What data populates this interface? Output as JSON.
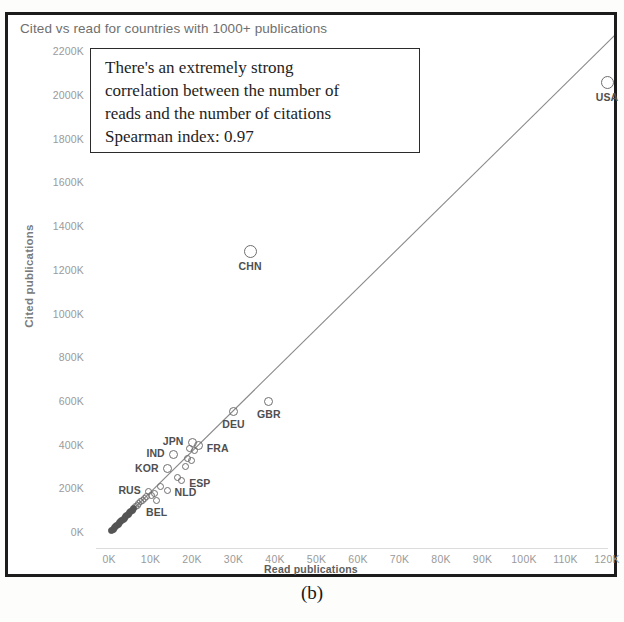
{
  "figure": {
    "caption": "(b)",
    "chart_title": "Cited vs read for countries with 1000+ publications"
  },
  "annotation": {
    "line1": "There's an extremely strong",
    "line2": "correlation between the number of",
    "line3": "reads and the number of citations",
    "line4": "Spearman index: 0.97"
  },
  "chart_data": {
    "type": "scatter",
    "title": "Cited vs read for countries with 1000+ publications",
    "xlabel": "Read publications",
    "ylabel": "Cited publications",
    "xlim": [
      0,
      125000
    ],
    "ylim": [
      0,
      2300000
    ],
    "grid": false,
    "legend": null,
    "spearman_index": 0.97,
    "trendline": {
      "type": "linear",
      "x0": 0,
      "y0": 0,
      "x1": 122000,
      "y1": 2280000
    },
    "xticks": [
      "0K",
      "10K",
      "20K",
      "30K",
      "40K",
      "50K",
      "60K",
      "70K",
      "80K",
      "90K",
      "100K",
      "110K",
      "120K"
    ],
    "xtick_values": [
      0,
      10000,
      20000,
      30000,
      40000,
      50000,
      60000,
      70000,
      80000,
      90000,
      100000,
      110000,
      120000
    ],
    "yticks": [
      "0K",
      "200K",
      "400K",
      "600K",
      "800K",
      "1000K",
      "1200K",
      "1400K",
      "1600K",
      "1800K",
      "2000K",
      "2200K"
    ],
    "ytick_values": [
      0,
      200000,
      400000,
      600000,
      800000,
      1000000,
      1200000,
      1400000,
      1600000,
      1800000,
      2000000,
      2200000
    ],
    "points": [
      {
        "label": "USA",
        "x": 120000,
        "y": 2060000,
        "label_pos": "below",
        "size": "large"
      },
      {
        "label": "CHN",
        "x": 34000,
        "y": 1290000,
        "label_pos": "below",
        "size": "large"
      },
      {
        "label": "GBR",
        "x": 38500,
        "y": 600000,
        "label_pos": "below",
        "size": "medium"
      },
      {
        "label": "DEU",
        "x": 30000,
        "y": 555000,
        "label_pos": "below",
        "size": "medium"
      },
      {
        "label": "FRA",
        "x": 21500,
        "y": 400000,
        "label_pos": "right",
        "size": "medium"
      },
      {
        "label": "JPN",
        "x": 20000,
        "y": 415000,
        "label_pos": "left",
        "size": "medium"
      },
      {
        "label": "IND",
        "x": 15500,
        "y": 360000,
        "label_pos": "left",
        "size": "medium"
      },
      {
        "label": "KOR",
        "x": 14000,
        "y": 295000,
        "label_pos": "left",
        "size": "medium"
      },
      {
        "label": "ESP",
        "x": 17500,
        "y": 240000,
        "label_pos": "right",
        "size": "small"
      },
      {
        "label": "NLD",
        "x": 14000,
        "y": 195000,
        "label_pos": "right",
        "size": "small"
      },
      {
        "label": "RUS",
        "x": 9500,
        "y": 190000,
        "label_pos": "left",
        "size": "small"
      },
      {
        "label": "BEL",
        "x": 11500,
        "y": 150000,
        "label_pos": "below",
        "size": "small"
      }
    ],
    "unlabeled_points": [
      {
        "x": 19500,
        "y": 385000
      },
      {
        "x": 20500,
        "y": 378000
      },
      {
        "x": 19000,
        "y": 340000
      },
      {
        "x": 19800,
        "y": 330000
      },
      {
        "x": 18500,
        "y": 305000
      },
      {
        "x": 16500,
        "y": 255000
      },
      {
        "x": 12500,
        "y": 215000
      },
      {
        "x": 11000,
        "y": 180000
      },
      {
        "x": 10200,
        "y": 172000
      },
      {
        "x": 9000,
        "y": 165000
      },
      {
        "x": 8500,
        "y": 160000
      },
      {
        "x": 8000,
        "y": 150000
      },
      {
        "x": 7600,
        "y": 143000
      },
      {
        "x": 7200,
        "y": 135000
      },
      {
        "x": 6800,
        "y": 128000
      },
      {
        "x": 6400,
        "y": 120000
      },
      {
        "x": 6000,
        "y": 112000
      },
      {
        "x": 5600,
        "y": 105000
      },
      {
        "x": 5200,
        "y": 98000
      },
      {
        "x": 4900,
        "y": 92000
      },
      {
        "x": 4600,
        "y": 86000
      },
      {
        "x": 4300,
        "y": 80000
      },
      {
        "x": 4000,
        "y": 74000
      },
      {
        "x": 3700,
        "y": 68000
      },
      {
        "x": 3400,
        "y": 62000
      },
      {
        "x": 3100,
        "y": 57000
      },
      {
        "x": 2800,
        "y": 52000
      },
      {
        "x": 2500,
        "y": 46000
      },
      {
        "x": 2200,
        "y": 41000
      },
      {
        "x": 1900,
        "y": 35000
      },
      {
        "x": 1600,
        "y": 29000
      },
      {
        "x": 1300,
        "y": 23000
      },
      {
        "x": 1000,
        "y": 18000
      },
      {
        "x": 700,
        "y": 12000
      }
    ]
  }
}
